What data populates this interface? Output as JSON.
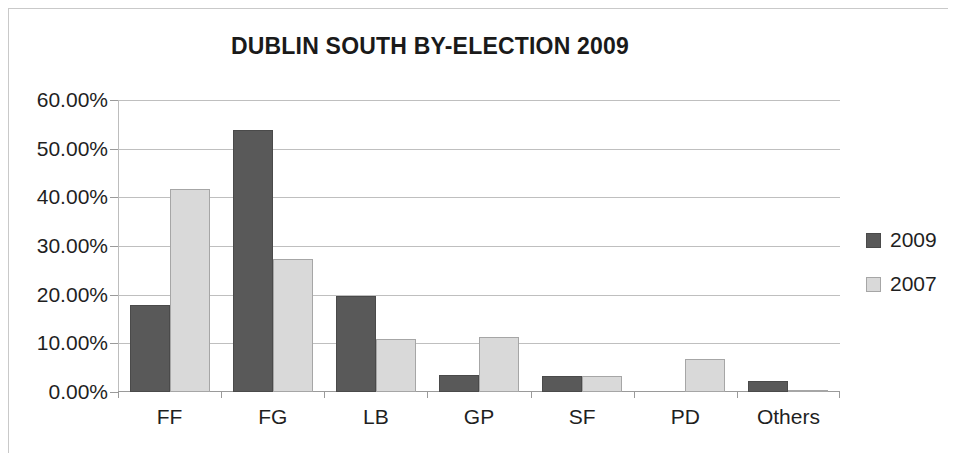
{
  "chart_data": {
    "type": "bar",
    "title": "DUBLIN SOUTH BY-ELECTION 2009",
    "xlabel": "",
    "ylabel": "",
    "categories": [
      "FF",
      "FG",
      "LB",
      "GP",
      "SF",
      "PD",
      "Others"
    ],
    "series": [
      {
        "name": "2009",
        "color": "#595959",
        "values": [
          17.9,
          53.8,
          19.7,
          3.5,
          3.3,
          0.0,
          2.2
        ]
      },
      {
        "name": "2007",
        "color": "#d9d9d9",
        "values": [
          41.7,
          27.3,
          10.8,
          11.3,
          3.2,
          6.7,
          0.4
        ]
      }
    ],
    "ylim": [
      0,
      60
    ],
    "y_tick_labels": [
      "60.00%",
      "50.00%",
      "40.00%",
      "30.00%",
      "20.00%",
      "10.00%",
      "0.00%"
    ],
    "y_tick_values": [
      60,
      50,
      40,
      30,
      20,
      10,
      0
    ],
    "grid": true,
    "legend_position": "right"
  }
}
